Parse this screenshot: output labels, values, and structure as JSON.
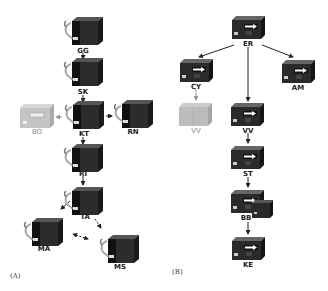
{
  "panels": {
    "a": {
      "label": "(A)",
      "nodes": {
        "gg": "GG",
        "sk": "SK",
        "kt": "KT",
        "bo": "BO",
        "rn": "RN",
        "ri": "RI",
        "ta": "TA",
        "ma": "MA",
        "ms": "MS"
      }
    },
    "b": {
      "label": "(B)",
      "nodes": {
        "er": "ER",
        "cy": "CY",
        "am": "AM",
        "vv_grey": "VV",
        "vv": "VV",
        "st": "ST",
        "bb": "BB",
        "ke": "KE"
      }
    }
  },
  "colors": {
    "device_dark": "#2a2a2a",
    "device_grey": "#b8b8b8",
    "arrow": "#222222",
    "arrow_light": "#999999"
  }
}
